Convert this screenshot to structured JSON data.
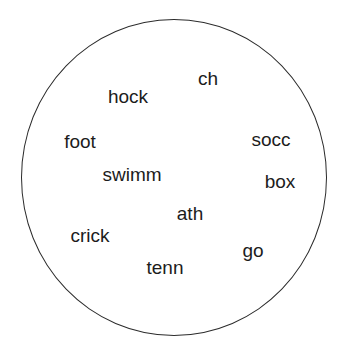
{
  "diagram": {
    "type": "word-cloud-in-circle",
    "background_color": "#ffffff",
    "outline_color": "#2b2b2b",
    "text_color": "#1c1c1c",
    "shape": {
      "name": "circle-outline",
      "center_x": 174,
      "center_y": 177,
      "width": 306,
      "height": 317
    },
    "words": [
      {
        "text": "ch",
        "x": 208,
        "y": 78,
        "size": 19
      },
      {
        "text": "hock",
        "x": 128,
        "y": 96,
        "size": 19
      },
      {
        "text": "foot",
        "x": 80,
        "y": 141,
        "size": 19
      },
      {
        "text": "socc",
        "x": 271,
        "y": 139,
        "size": 19
      },
      {
        "text": "swimm",
        "x": 132,
        "y": 174,
        "size": 19
      },
      {
        "text": "box",
        "x": 280,
        "y": 181,
        "size": 19
      },
      {
        "text": "ath",
        "x": 190,
        "y": 213,
        "size": 19
      },
      {
        "text": "crick",
        "x": 90,
        "y": 235,
        "size": 19
      },
      {
        "text": "go",
        "x": 253,
        "y": 250,
        "size": 19
      },
      {
        "text": "tenn",
        "x": 165,
        "y": 267,
        "size": 19
      }
    ]
  }
}
